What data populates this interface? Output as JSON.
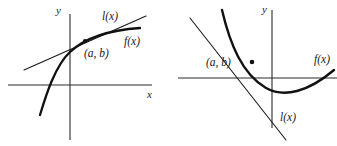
{
  "figure": {
    "stroke_color": "#1a1a1a",
    "background_color": "#ffffff"
  },
  "panels": [
    {
      "id": "left",
      "description": "Concave-down increasing curve f(x) with tangent line l(x) lying above the curve, touching at point (a, b) in the first quadrant.",
      "axes": {
        "x_label": "x",
        "y_label": "y",
        "origin_x": 70,
        "origin_y": 85,
        "x_axis_from": 8,
        "x_axis_to": 152,
        "y_axis_from": 14,
        "y_axis_to": 140
      },
      "curve": {
        "name": "f(x)",
        "label": "f(x)",
        "shape": "concave-down-increasing",
        "path": "M 40,115 C 46,95 55,66 70,52 C 85,38 110,30 140,28"
      },
      "tangent": {
        "name": "l(x)",
        "label": "l(x)",
        "path": "M 24,70 L 146,16"
      },
      "point": {
        "label": "(a, b)",
        "x": 85,
        "y": 41
      },
      "labels": [
        {
          "name": "y-axis-label",
          "text": "y",
          "x": 56,
          "y": 5
        },
        {
          "name": "x-axis-label",
          "text": "x",
          "x": 147,
          "y": 89
        },
        {
          "name": "tangent-label",
          "text": "l(x)",
          "x": 102,
          "y": 11
        },
        {
          "name": "curve-label",
          "text": "f(x)",
          "x": 124,
          "y": 36
        },
        {
          "name": "point-label",
          "text": "(a, b)",
          "x": 84,
          "y": 48
        }
      ]
    },
    {
      "id": "right",
      "description": "Concave-up parabola f(x) with tangent line l(x) lying below the curve, touching at point (a, b) to the left of the y-axis.",
      "axes": {
        "x_label": "y",
        "y_label": "y",
        "origin_x": 104,
        "origin_y": 78,
        "x_axis_from": 10,
        "x_axis_to": 169,
        "y_axis_from": 10,
        "y_axis_to": 128
      },
      "curve": {
        "name": "f(x)",
        "label": "f(x)",
        "shape": "concave-up-parabola",
        "path": "M 54,10 C 62,44 74,74 98,88 C 116,98 140,92 166,70"
      },
      "tangent": {
        "name": "l(x)",
        "label": "l(x)",
        "path": "M 22,18 L 118,140"
      },
      "point": {
        "label": "(a, b)",
        "x": 84,
        "y": 62
      },
      "labels": [
        {
          "name": "y-axis-label",
          "text": "y",
          "x": 94,
          "y": 4
        },
        {
          "name": "tangent-label",
          "text": "l(x)",
          "x": 112,
          "y": 112
        },
        {
          "name": "curve-label",
          "text": "f(x)",
          "x": 146,
          "y": 54
        },
        {
          "name": "point-label",
          "text": "(a, b)",
          "x": 38,
          "y": 57
        }
      ]
    }
  ]
}
